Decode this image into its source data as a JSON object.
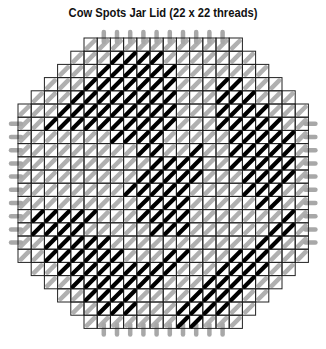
{
  "title": "Cow Spots Jar Lid (22 x 22 threads)",
  "colors": {
    "background": "#ffffff",
    "grid_line": "#222222",
    "background_stitch": "#a8a8a8",
    "spot_stitch": "#000000",
    "title": "#111111"
  },
  "chart_data": {
    "type": "heatmap",
    "title": "Cow Spots Jar Lid (22 x 22 threads)",
    "grid": {
      "columns": 22,
      "rows": 22,
      "shape": "octagon",
      "corner_cut": 6
    },
    "legend": [
      {
        "name": "background (white) stitches",
        "color": "#a8a8a8"
      },
      {
        "name": "cow spot (black) stitches",
        "color": "#000000"
      }
    ],
    "spots": [
      {
        "name": "top-left spot",
        "cells": [
          [
            2,
            6
          ],
          [
            3,
            5
          ],
          [
            4,
            4
          ],
          [
            5,
            3
          ],
          [
            6,
            2
          ],
          [
            7,
            1
          ],
          [
            3,
            6
          ],
          [
            4,
            5
          ],
          [
            5,
            4
          ],
          [
            6,
            3
          ],
          [
            7,
            2
          ],
          [
            8,
            1
          ],
          [
            4,
            6
          ],
          [
            5,
            5
          ],
          [
            6,
            4
          ],
          [
            7,
            3
          ],
          [
            8,
            2
          ],
          [
            9,
            1
          ],
          [
            5,
            6
          ],
          [
            6,
            5
          ],
          [
            7,
            4
          ],
          [
            8,
            3
          ],
          [
            9,
            2
          ],
          [
            10,
            1
          ],
          [
            6,
            6
          ],
          [
            7,
            5
          ],
          [
            8,
            4
          ],
          [
            9,
            3
          ],
          [
            10,
            2
          ],
          [
            7,
            6
          ],
          [
            8,
            5
          ],
          [
            9,
            4
          ],
          [
            10,
            3
          ],
          [
            11,
            2
          ],
          [
            7,
            7
          ],
          [
            8,
            6
          ],
          [
            9,
            5
          ],
          [
            10,
            4
          ],
          [
            11,
            3
          ],
          [
            8,
            7
          ],
          [
            9,
            6
          ],
          [
            10,
            5
          ],
          [
            11,
            4
          ],
          [
            9,
            7
          ],
          [
            10,
            6
          ],
          [
            11,
            5
          ],
          [
            10,
            7
          ],
          [
            11,
            6
          ],
          [
            9,
            8
          ],
          [
            10,
            8
          ]
        ]
      },
      {
        "name": "top-right spot",
        "cells": [
          [
            15,
            3
          ],
          [
            16,
            4
          ],
          [
            16,
            3
          ],
          [
            17,
            4
          ],
          [
            17,
            5
          ],
          [
            18,
            5
          ],
          [
            18,
            6
          ],
          [
            19,
            6
          ],
          [
            19,
            7
          ],
          [
            20,
            7
          ],
          [
            20,
            8
          ],
          [
            15,
            4
          ],
          [
            15,
            5
          ],
          [
            16,
            5
          ],
          [
            16,
            6
          ],
          [
            17,
            6
          ],
          [
            17,
            7
          ],
          [
            18,
            7
          ],
          [
            18,
            8
          ],
          [
            19,
            8
          ],
          [
            19,
            9
          ],
          [
            16,
            7
          ],
          [
            17,
            8
          ],
          [
            18,
            9
          ],
          [
            19,
            10
          ],
          [
            20,
            9
          ],
          [
            20,
            10
          ],
          [
            15,
            6
          ],
          [
            16,
            8
          ],
          [
            17,
            9
          ],
          [
            18,
            10
          ],
          [
            17,
            10
          ],
          [
            18,
            11
          ],
          [
            19,
            11
          ],
          [
            16,
            9
          ],
          [
            17,
            11
          ],
          [
            18,
            12
          ],
          [
            19,
            12
          ]
        ]
      },
      {
        "name": "center spot",
        "cells": [
          [
            10,
            9
          ],
          [
            11,
            9
          ],
          [
            12,
            9
          ],
          [
            13,
            8
          ],
          [
            9,
            10
          ],
          [
            10,
            10
          ],
          [
            11,
            10
          ],
          [
            12,
            10
          ],
          [
            13,
            9
          ],
          [
            8,
            11
          ],
          [
            9,
            11
          ],
          [
            10,
            11
          ],
          [
            11,
            11
          ],
          [
            12,
            11
          ],
          [
            13,
            10
          ],
          [
            9,
            12
          ],
          [
            10,
            12
          ],
          [
            11,
            12
          ],
          [
            12,
            12
          ],
          [
            9,
            13
          ],
          [
            10,
            13
          ],
          [
            11,
            13
          ],
          [
            12,
            13
          ],
          [
            10,
            14
          ],
          [
            11,
            14
          ],
          [
            12,
            14
          ]
        ]
      },
      {
        "name": "bottom-left spot",
        "cells": [
          [
            1,
            13
          ],
          [
            2,
            13
          ],
          [
            3,
            13
          ],
          [
            4,
            13
          ],
          [
            5,
            13
          ],
          [
            1,
            14
          ],
          [
            2,
            14
          ],
          [
            3,
            14
          ],
          [
            4,
            14
          ],
          [
            2,
            15
          ],
          [
            3,
            15
          ],
          [
            4,
            15
          ],
          [
            5,
            15
          ],
          [
            6,
            15
          ],
          [
            2,
            16
          ],
          [
            3,
            16
          ],
          [
            4,
            16
          ],
          [
            5,
            16
          ],
          [
            6,
            16
          ],
          [
            7,
            16
          ],
          [
            3,
            17
          ],
          [
            4,
            17
          ],
          [
            5,
            17
          ],
          [
            6,
            17
          ],
          [
            7,
            17
          ],
          [
            8,
            17
          ],
          [
            9,
            17
          ],
          [
            4,
            18
          ],
          [
            5,
            18
          ],
          [
            6,
            18
          ],
          [
            7,
            18
          ],
          [
            8,
            18
          ],
          [
            9,
            18
          ],
          [
            10,
            18
          ],
          [
            5,
            19
          ],
          [
            6,
            19
          ],
          [
            7,
            19
          ],
          [
            8,
            19
          ],
          [
            6,
            20
          ],
          [
            7,
            20
          ],
          [
            8,
            20
          ],
          [
            11,
            16
          ],
          [
            12,
            16
          ],
          [
            10,
            17
          ],
          [
            11,
            17
          ]
        ]
      },
      {
        "name": "bottom-right spot",
        "cells": [
          [
            20,
            13
          ],
          [
            20,
            14
          ],
          [
            19,
            14
          ],
          [
            18,
            15
          ],
          [
            19,
            15
          ],
          [
            17,
            16
          ],
          [
            18,
            16
          ],
          [
            16,
            16
          ],
          [
            15,
            17
          ],
          [
            16,
            17
          ],
          [
            17,
            17
          ],
          [
            18,
            17
          ],
          [
            14,
            18
          ],
          [
            15,
            18
          ],
          [
            16,
            18
          ],
          [
            17,
            18
          ],
          [
            13,
            19
          ],
          [
            14,
            19
          ],
          [
            15,
            19
          ],
          [
            16,
            19
          ],
          [
            12,
            20
          ],
          [
            13,
            20
          ],
          [
            14,
            20
          ],
          [
            15,
            20
          ],
          [
            12,
            21
          ],
          [
            13,
            21
          ]
        ]
      }
    ]
  }
}
